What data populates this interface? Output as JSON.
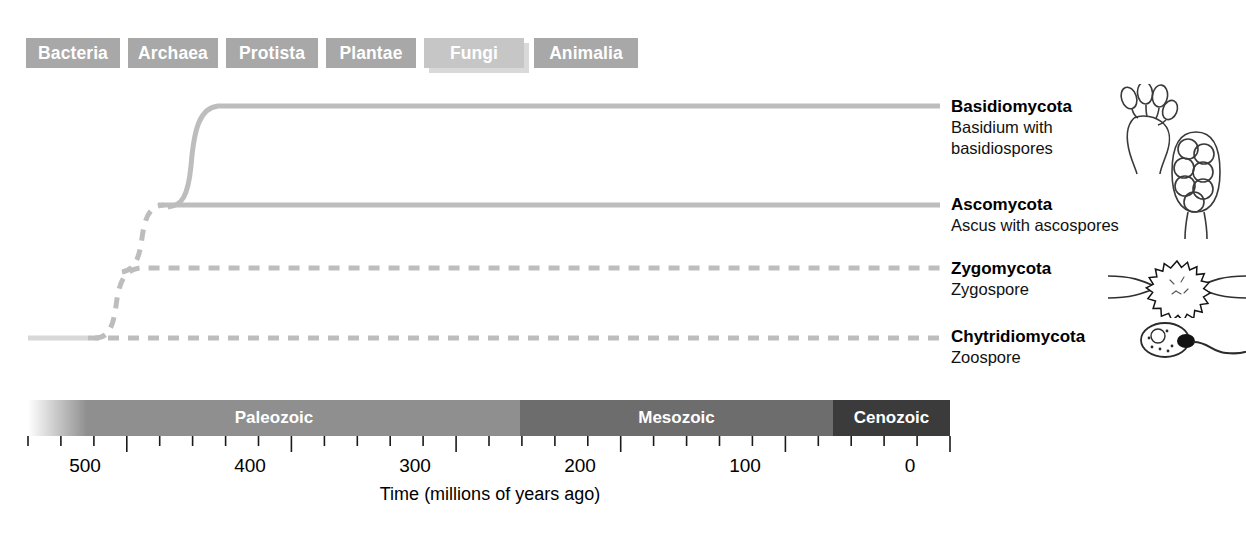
{
  "kingdom_tabs": {
    "items": [
      {
        "label": "Bacteria",
        "left": 0,
        "width": 94,
        "selected": false
      },
      {
        "label": "Archaea",
        "left": 102,
        "width": 90,
        "selected": false
      },
      {
        "label": "Protista",
        "left": 200,
        "width": 92,
        "selected": false
      },
      {
        "label": "Plantae",
        "left": 300,
        "width": 90,
        "selected": false
      },
      {
        "label": "Fungi",
        "left": 398,
        "width": 100,
        "selected": true
      },
      {
        "label": "Animalia",
        "left": 508,
        "width": 104,
        "selected": false
      }
    ],
    "selected": "Fungi",
    "unselected_color": "#a8a8a8",
    "selected_color": "#c6c6c6",
    "text_color": "#ffffff"
  },
  "tree": {
    "line_color": "#b9b9b9",
    "branches": [
      {
        "name": "Basidiomycota",
        "description": "Basidium with basidiospores",
        "style": "solid",
        "origin_mya": 395,
        "tip_y": 105,
        "icon": "basidium-icon"
      },
      {
        "name": "Ascomycota",
        "description": "Ascus with ascospores",
        "style": "solid",
        "origin_mya": 430,
        "tip_y": 205,
        "icon": "ascus-icon"
      },
      {
        "name": "Zygomycota",
        "description": "Zygospore",
        "style": "dashed",
        "origin_mya": 475,
        "tip_y": 268,
        "icon": "zygospore-icon"
      },
      {
        "name": "Chytridiomycota",
        "description": "Zoospore",
        "style": "dashed",
        "origin_mya": 530,
        "tip_y": 338,
        "icon": "zoospore-icon"
      }
    ]
  },
  "chart_data": {
    "type": "line",
    "title": "",
    "xlabel": "Time (millions of years ago)",
    "ylabel": "",
    "xlim": [
      560,
      0
    ],
    "x_reversed": true,
    "grid": false,
    "legend_position": "right",
    "tick_labels": [
      "500",
      "400",
      "300",
      "200",
      "100",
      "0"
    ],
    "tick_values": [
      500,
      400,
      300,
      200,
      100,
      0
    ],
    "minor_tick_interval": 20,
    "series": [
      {
        "name": "Basidiomycota",
        "origin_mya": 395,
        "style": "solid",
        "level": 4
      },
      {
        "name": "Ascomycota",
        "origin_mya": 430,
        "style": "solid",
        "level": 3
      },
      {
        "name": "Zygomycota",
        "origin_mya": 475,
        "style": "dashed",
        "level": 2
      },
      {
        "name": "Chytridiomycota",
        "origin_mya": 530,
        "style": "dashed",
        "level": 1
      }
    ],
    "eras": [
      {
        "name": "Paleozoic",
        "start_mya": 560,
        "end_mya": 251,
        "color": "#8f8f8f"
      },
      {
        "name": "Mesozoic",
        "start_mya": 251,
        "end_mya": 66,
        "color": "#6d6d6d"
      },
      {
        "name": "Cenozoic",
        "start_mya": 66,
        "end_mya": 0,
        "color": "#3b3b3b"
      }
    ]
  },
  "timeline": {
    "eras": [
      {
        "label": "Paleozoic",
        "left": 0,
        "width": 492
      },
      {
        "label": "Mesozoic",
        "left": 492,
        "width": 313
      },
      {
        "label": "Cenozoic",
        "left": 805,
        "width": 117
      }
    ]
  },
  "axis": {
    "title": "Time (millions of years ago)",
    "labels": [
      {
        "text": "500",
        "x": 85
      },
      {
        "text": "400",
        "x": 250
      },
      {
        "text": "300",
        "x": 415
      },
      {
        "text": "200",
        "x": 580
      },
      {
        "text": "100",
        "x": 745
      },
      {
        "text": "0",
        "x": 910
      }
    ]
  }
}
